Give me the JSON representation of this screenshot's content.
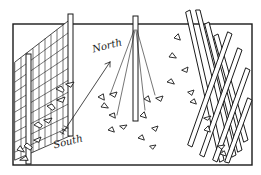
{
  "illustration": {
    "subject": "Three garden trellis types for climbing plants",
    "labels": {
      "north": "North",
      "south": "South"
    },
    "elements": [
      "mesh-fence-trellis",
      "teepee-string-trellis",
      "a-frame-lattice-trellis"
    ],
    "colors": {
      "ink": "#1a1a1a",
      "background": "#ffffff"
    }
  }
}
